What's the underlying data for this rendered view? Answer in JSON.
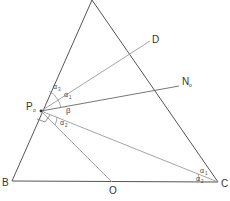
{
  "diagram": {
    "colors": {
      "main_line": "#555555",
      "light_line": "#9a9a9a",
      "label": "#333333"
    },
    "points": {
      "A": {
        "x": 92,
        "y": 0
      },
      "B": {
        "x": 12,
        "y": 181
      },
      "C": {
        "x": 218,
        "y": 182
      },
      "P0": {
        "x": 41,
        "y": 111
      },
      "D": {
        "x": 150,
        "y": 41
      },
      "N0": {
        "x": 179,
        "y": 86
      },
      "O": {
        "x": 112,
        "y": 182
      }
    },
    "labels": {
      "B": "B",
      "C": "C",
      "D": "D",
      "O": "O",
      "P": "P",
      "P_sub": "o",
      "N": "N",
      "N_sub": "o",
      "alpha": "α",
      "alpha3_sub": "3",
      "alpha1_sub": "1",
      "alpha2_sub": "2",
      "beta": "β"
    }
  }
}
